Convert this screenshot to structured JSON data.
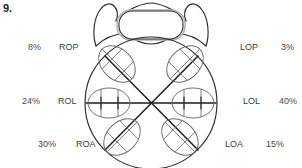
{
  "figure": {
    "number": "9.",
    "type": "obstetric-position-diagram"
  },
  "colors": {
    "outline": "#2b2b2b",
    "axis": "#1d1d1d",
    "head": "#6e6a66",
    "symphysis": "#b9b4ae",
    "text": "#4a4a4a",
    "background": "#ffffff"
  },
  "positions": [
    {
      "id": "rop",
      "abbr": "ROP",
      "percent": "8%",
      "side": "left",
      "row": "top"
    },
    {
      "id": "lop",
      "abbr": "LOP",
      "percent": "3%",
      "side": "right",
      "row": "top"
    },
    {
      "id": "rol",
      "abbr": "ROL",
      "percent": "24%",
      "side": "left",
      "row": "middle"
    },
    {
      "id": "lol",
      "abbr": "LOL",
      "percent": "40%",
      "side": "right",
      "row": "middle"
    },
    {
      "id": "roa",
      "abbr": "ROA",
      "percent": "30%",
      "side": "left",
      "row": "bottom"
    },
    {
      "id": "loa",
      "abbr": "LOA",
      "percent": "15%",
      "side": "right",
      "row": "bottom"
    }
  ]
}
